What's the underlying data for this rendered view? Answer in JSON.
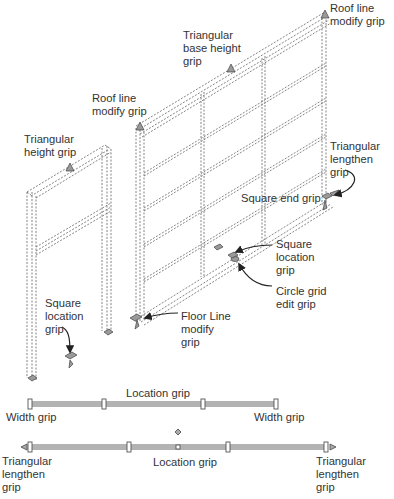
{
  "labels": {
    "roof_line_top": "Roof line\nmodify grip",
    "triangular_base_height": "Triangular\nbase height\ngrip",
    "roof_line_left": "Roof line\nmodify grip",
    "triangular_height": "Triangular\nheight grip",
    "triangular_lengthen_right": "Triangular\nlengthen\ngrip",
    "square_end": "Square end grip",
    "square_location_right": "Square\nlocation\ngrip",
    "circle_grid_edit": "Circle grid\nedit grip",
    "square_location_left": "Square\nlocation\ngrip",
    "floor_line_modify": "Floor Line\nmodify\ngrip",
    "location_grip_plan1": "Location grip",
    "width_grip_left": "Width grip",
    "width_grip_right": "Width grip",
    "triangular_lengthen_plan_left": "Triangular\nlengthen\ngrip",
    "location_grip_plan2": "Location grip",
    "triangular_lengthen_plan_right": "Triangular\nlengthen\ngrip"
  },
  "colors": {
    "line": "#555555",
    "grip_fill": "#9a9a9a",
    "arrow": "#222222",
    "text": "#333333"
  }
}
